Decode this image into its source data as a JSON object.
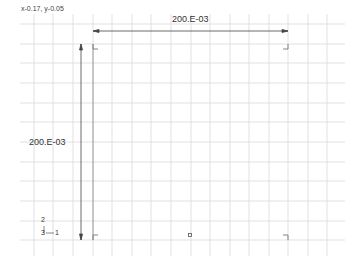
{
  "viewport": {
    "cursor_coords": "x-0.17, y-0.05"
  },
  "dimensions": {
    "horizontal": {
      "label": "200.E-03"
    },
    "vertical": {
      "label": "200.E-03"
    }
  },
  "axis_triad": {
    "labels": [
      "2",
      "3",
      "1"
    ]
  },
  "colors": {
    "grid": "#d6d6d6",
    "geometry": "#555555",
    "dimension": "#444444",
    "background": "#ffffff"
  }
}
